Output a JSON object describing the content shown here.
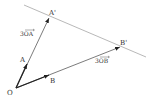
{
  "diagram": {
    "colors": {
      "vector": "#222222",
      "line": "#9a9a9a",
      "text": "#333333"
    },
    "points": {
      "O": {
        "label": "O",
        "x": 16,
        "y": 88
      },
      "A": {
        "label": "A",
        "x": 27,
        "y": 64
      },
      "B": {
        "label": "B",
        "x": 49,
        "y": 75
      },
      "A_prime": {
        "label": "A'",
        "x": 49,
        "y": 18
      },
      "B_prime": {
        "label": "B'",
        "x": 120,
        "y": 47
      }
    },
    "vector_labels": {
      "three_OA": {
        "text": "3OA",
        "x": 20,
        "y": 36
      },
      "three_OB": {
        "text": "3OB",
        "x": 95,
        "y": 63
      }
    },
    "line": {
      "x1": 24,
      "y1": 5,
      "x2": 146,
      "y2": 57
    }
  }
}
